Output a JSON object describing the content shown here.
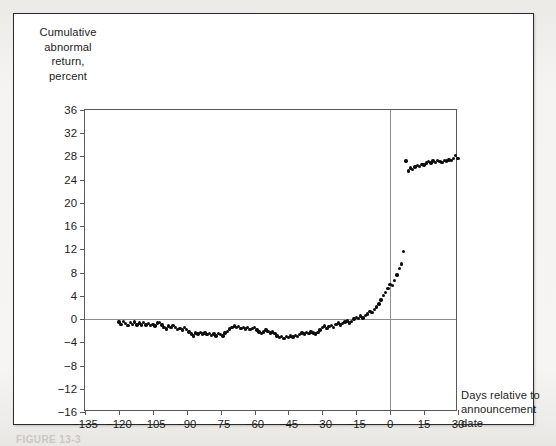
{
  "figure": {
    "caption_partial": "FIGURE 13-3"
  },
  "chart_data": {
    "type": "scatter",
    "title": "",
    "ylabel": "Cumulative\nabnormal\nreturn,\npercent",
    "xlabel": "Days relative to\nannouncement\ndate",
    "xlim": [
      -135,
      30
    ],
    "ylim": [
      -16,
      36
    ],
    "xticks": [
      -135,
      -120,
      -105,
      -90,
      -75,
      -60,
      -45,
      -30,
      -15,
      0,
      15,
      30
    ],
    "xtick_labels": [
      "−135",
      "−120",
      "−105",
      "−90",
      "−75",
      "−60",
      "−45",
      "−30",
      "−15",
      "0",
      "15",
      "30"
    ],
    "yticks": [
      36,
      32,
      28,
      24,
      20,
      16,
      12,
      8,
      4,
      0,
      -4,
      -8,
      -12,
      -16
    ],
    "ytick_labels": [
      "36",
      "32",
      "28",
      "24",
      "20",
      "16",
      "12",
      "8",
      "4",
      "0",
      "−4",
      "−8",
      "−12",
      "−16"
    ],
    "grid": false,
    "legend": null,
    "marker_color": "#0d0d0d",
    "reference_lines": [
      {
        "axis": "y",
        "value": 0,
        "color": "#8d8d8d"
      },
      {
        "axis": "x",
        "value": 0,
        "color": "#8d8d8d"
      }
    ],
    "x": [
      -120,
      -119,
      -118,
      -117,
      -116,
      -115,
      -114,
      -113,
      -112,
      -111,
      -110,
      -109,
      -108,
      -107,
      -106,
      -105,
      -104,
      -103,
      -102,
      -101,
      -100,
      -99,
      -98,
      -97,
      -96,
      -95,
      -94,
      -93,
      -92,
      -91,
      -90,
      -89,
      -88,
      -87,
      -86,
      -85,
      -84,
      -83,
      -82,
      -81,
      -80,
      -79,
      -78,
      -77,
      -76,
      -75,
      -74,
      -73,
      -72,
      -71,
      -70,
      -69,
      -68,
      -67,
      -66,
      -65,
      -64,
      -63,
      -62,
      -61,
      -60,
      -59,
      -58,
      -57,
      -56,
      -55,
      -54,
      -53,
      -52,
      -51,
      -50,
      -49,
      -48,
      -47,
      -46,
      -45,
      -44,
      -43,
      -42,
      -41,
      -40,
      -39,
      -38,
      -37,
      -36,
      -35,
      -34,
      -33,
      -32,
      -31,
      -30,
      -29,
      -28,
      -27,
      -26,
      -25,
      -24,
      -23,
      -22,
      -21,
      -20,
      -19,
      -18,
      -17,
      -16,
      -15,
      -14,
      -13,
      -12,
      -11,
      -10,
      -9,
      -8,
      -7,
      -6,
      -5,
      -4,
      -3,
      -2,
      -1,
      0,
      1,
      2,
      3,
      4,
      5,
      6,
      7,
      8,
      9,
      10,
      11,
      12,
      13,
      14,
      15,
      16,
      17,
      18,
      19,
      20,
      21,
      22,
      23,
      24,
      25,
      26,
      27,
      28,
      29,
      30
    ],
    "y": [
      -0.5,
      -0.9,
      -0.4,
      -0.8,
      -1.1,
      -0.6,
      -0.9,
      -0.5,
      -1.0,
      -0.7,
      -1.0,
      -0.6,
      -1.0,
      -0.8,
      -1.1,
      -0.9,
      -1.2,
      -0.7,
      -0.6,
      -1.0,
      -1.4,
      -1.7,
      -1.2,
      -1.5,
      -1.1,
      -1.4,
      -1.8,
      -1.6,
      -1.9,
      -1.5,
      -1.8,
      -2.2,
      -2.6,
      -2.9,
      -2.4,
      -2.6,
      -2.3,
      -2.6,
      -2.4,
      -2.7,
      -2.5,
      -2.8,
      -2.6,
      -2.9,
      -2.5,
      -2.7,
      -2.9,
      -2.4,
      -2.1,
      -1.7,
      -1.4,
      -1.2,
      -1.5,
      -1.3,
      -1.6,
      -1.4,
      -1.7,
      -1.5,
      -1.8,
      -1.6,
      -1.5,
      -1.9,
      -2.2,
      -2.5,
      -2.2,
      -1.9,
      -2.1,
      -2.4,
      -2.2,
      -2.5,
      -2.9,
      -3.2,
      -3.0,
      -3.3,
      -3.0,
      -3.2,
      -2.9,
      -3.1,
      -2.8,
      -3.0,
      -2.7,
      -2.4,
      -2.6,
      -2.3,
      -2.5,
      -2.2,
      -2.4,
      -2.6,
      -2.3,
      -1.9,
      -1.4,
      -1.2,
      -1.6,
      -1.3,
      -1.1,
      -1.4,
      -0.9,
      -0.7,
      -1.0,
      -0.8,
      -0.5,
      -0.3,
      -0.7,
      -0.4,
      0.0,
      0.3,
      0.1,
      0.5,
      0.2,
      0.6,
      0.9,
      1.3,
      1.1,
      1.6,
      2.1,
      2.6,
      3.3,
      4.1,
      4.6,
      5.3,
      6.0,
      5.8,
      6.6,
      7.6,
      8.7,
      9.5,
      11.6,
      27.2,
      25.5,
      26.0,
      25.8,
      26.2,
      26.4,
      26.3,
      26.6,
      26.5,
      26.9,
      27.1,
      26.9,
      27.2,
      27.0,
      27.3,
      27.1,
      27.0,
      27.3,
      27.2,
      27.4,
      27.3,
      27.6,
      28.2,
      27.6,
      27.1,
      26.6,
      26.8,
      26.6,
      26.9,
      26.8,
      27.0
    ]
  }
}
